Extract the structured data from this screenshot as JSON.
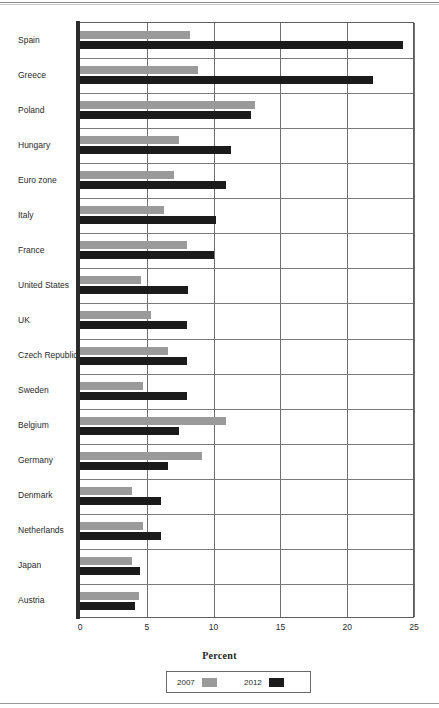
{
  "chart_data": {
    "type": "bar",
    "orientation": "horizontal",
    "title": "",
    "xlabel": "Percent",
    "ylabel": "",
    "xlim": [
      0,
      25
    ],
    "xticks": [
      0,
      5,
      10,
      15,
      20,
      25
    ],
    "grid": true,
    "legend_position": "bottom",
    "categories": [
      "Spain",
      "Greece",
      "Poland",
      "Hungary",
      "Euro zone",
      "Italy",
      "France",
      "United States",
      "UK",
      "Czech Republic",
      "Sweden",
      "Belgium",
      "Germany",
      "Denmark",
      "Netherlands",
      "Japan",
      "Austria"
    ],
    "series": [
      {
        "name": "2007",
        "color": "#9a9a9a",
        "values": [
          8.2,
          8.8,
          13.1,
          7.4,
          7.0,
          6.3,
          8.0,
          4.6,
          5.3,
          6.6,
          4.7,
          10.9,
          9.1,
          3.9,
          4.7,
          3.9,
          4.4
        ]
      },
      {
        "name": "2012",
        "color": "#1b1b1b",
        "values": [
          24.2,
          21.9,
          12.8,
          11.3,
          10.9,
          10.2,
          10.0,
          8.1,
          8.0,
          8.0,
          8.0,
          7.4,
          6.6,
          6.1,
          6.1,
          4.5,
          4.1
        ]
      }
    ]
  },
  "legend": {
    "entries": [
      {
        "label": "2007"
      },
      {
        "label": "2012"
      }
    ]
  }
}
